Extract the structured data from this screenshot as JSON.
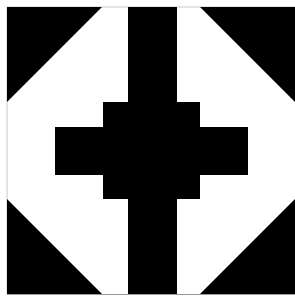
{
  "pattern": {
    "description": "Black and white geometric quilt block: central cross with stepped arms and corner triangles",
    "colors": {
      "background": "#ffffff",
      "foreground": "#000000",
      "frame_line": "#c8c8c8"
    },
    "frame": {
      "x": 7,
      "y": 7,
      "right": 295,
      "bottom": 294
    },
    "corner_triangles": [
      {
        "name": "top-left",
        "points": "7,7 102,7 7,102"
      },
      {
        "name": "top-right",
        "points": "200,7 295,7 295,102"
      },
      {
        "name": "bottom-left",
        "points": "7,199 7,294 102,294"
      },
      {
        "name": "bottom-right",
        "points": "295,199 295,294 200,294"
      }
    ],
    "cross": {
      "points": "128,7 177,7 177,102 200,102 200,127 248,127 248,175 200,175 200,199 177,199 177,294 128,294 128,199 103,199 103,175 55,175 55,127 103,127 103,102 128,102"
    }
  }
}
